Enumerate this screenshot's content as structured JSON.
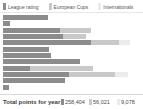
{
  "colors": {
    "league": "#8c8c8c",
    "european": "#c9c9c9",
    "internationals": "#ebebeb",
    "background": "#ffffff",
    "text": "#4a4a4a"
  },
  "legend": {
    "items": [
      {
        "label": "League rating",
        "color": "#8c8c8c",
        "key": "league"
      },
      {
        "label": "European Cups",
        "color": "#c9c9c9",
        "key": "european"
      },
      {
        "label": "Internationals",
        "color": "#ebebeb",
        "key": "internationals"
      }
    ]
  },
  "totals": {
    "label": "Total points for year",
    "items": [
      {
        "value": "258,404",
        "color": "#8c8c8c"
      },
      {
        "value": "56,021",
        "color": "#c9c9c9"
      },
      {
        "value": "9,078",
        "color": "#ebebeb"
      }
    ]
  },
  "chart_data": {
    "type": "bar",
    "orientation": "horizontal",
    "stacked": true,
    "title": "",
    "xlabel": "",
    "ylabel": "",
    "grid": false,
    "legend_position": "top",
    "categories": [
      "row-1",
      "row-2",
      "row-3",
      "row-4",
      "row-5",
      "row-6",
      "row-7",
      "row-8",
      "row-9",
      "row-10",
      "row-11",
      "row-12"
    ],
    "xlim": [
      0,
      100
    ],
    "series": [
      {
        "name": "League rating",
        "color": "#8c8c8c",
        "values": [
          32,
          5,
          41,
          43,
          63,
          33,
          34,
          55,
          19,
          47,
          44,
          4
        ]
      },
      {
        "name": "European Cups",
        "color": "#c9c9c9",
        "values": [
          0,
          0,
          22,
          16,
          20,
          0,
          0,
          0,
          45,
          33,
          0,
          0
        ]
      },
      {
        "name": "Internationals",
        "color": "#ebebeb",
        "values": [
          0,
          0,
          0,
          0,
          8,
          0,
          0,
          0,
          0,
          9,
          0,
          0
        ]
      }
    ]
  }
}
